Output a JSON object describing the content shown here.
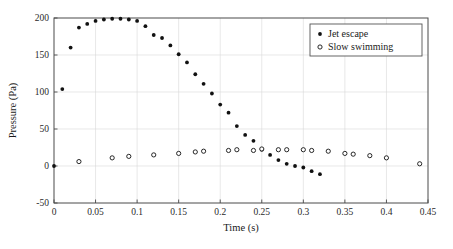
{
  "chart_data": {
    "type": "scatter",
    "title": "",
    "xlabel": "Time (s)",
    "ylabel": "Pressure (Pa)",
    "xlim": [
      0,
      0.45
    ],
    "ylim": [
      -50,
      200
    ],
    "xticks": [
      0,
      0.05,
      0.1,
      0.15,
      0.2,
      0.25,
      0.3,
      0.35,
      0.4,
      0.45
    ],
    "xticklabels": [
      "0",
      "0.05",
      "0.1",
      "0.15",
      "0.2",
      "0.25",
      "0.3",
      "0.35",
      "0.4",
      "0.45"
    ],
    "yticks": [
      -50,
      0,
      50,
      100,
      150,
      200
    ],
    "yticklabels": [
      "-50",
      "0",
      "50",
      "100",
      "150",
      "200"
    ],
    "grid": true,
    "legend_position": "upper right",
    "series": [
      {
        "name": "Jet escape",
        "marker": "filled-circle",
        "color": "#111111",
        "points": [
          [
            0.0,
            0
          ],
          [
            0.01,
            104
          ],
          [
            0.02,
            160
          ],
          [
            0.03,
            187
          ],
          [
            0.04,
            192
          ],
          [
            0.05,
            196
          ],
          [
            0.06,
            198
          ],
          [
            0.07,
            199
          ],
          [
            0.08,
            199
          ],
          [
            0.09,
            198
          ],
          [
            0.1,
            196
          ],
          [
            0.11,
            189
          ],
          [
            0.12,
            177
          ],
          [
            0.13,
            173
          ],
          [
            0.14,
            163
          ],
          [
            0.15,
            151
          ],
          [
            0.16,
            140
          ],
          [
            0.17,
            124
          ],
          [
            0.18,
            111
          ],
          [
            0.19,
            98
          ],
          [
            0.2,
            83
          ],
          [
            0.21,
            72
          ],
          [
            0.22,
            54
          ],
          [
            0.23,
            42
          ],
          [
            0.24,
            34
          ],
          [
            0.25,
            22
          ],
          [
            0.26,
            15
          ],
          [
            0.27,
            8
          ],
          [
            0.28,
            3
          ],
          [
            0.29,
            0
          ],
          [
            0.3,
            -2
          ],
          [
            0.31,
            -7
          ],
          [
            0.32,
            -11
          ]
        ]
      },
      {
        "name": "Slow swimming",
        "marker": "open-circle",
        "color": "#111111",
        "points": [
          [
            0.03,
            6
          ],
          [
            0.07,
            11
          ],
          [
            0.09,
            13
          ],
          [
            0.12,
            15
          ],
          [
            0.15,
            17
          ],
          [
            0.17,
            19
          ],
          [
            0.18,
            20
          ],
          [
            0.21,
            21
          ],
          [
            0.22,
            22
          ],
          [
            0.24,
            21
          ],
          [
            0.25,
            23
          ],
          [
            0.27,
            22
          ],
          [
            0.28,
            22
          ],
          [
            0.3,
            22
          ],
          [
            0.31,
            21
          ],
          [
            0.33,
            20
          ],
          [
            0.35,
            17
          ],
          [
            0.36,
            16
          ],
          [
            0.38,
            14
          ],
          [
            0.4,
            11
          ],
          [
            0.44,
            3
          ]
        ]
      }
    ]
  },
  "legend": {
    "entries": [
      {
        "label": "Jet escape",
        "marker": "filled-circle"
      },
      {
        "label": "Slow swimming",
        "marker": "open-circle"
      }
    ]
  }
}
